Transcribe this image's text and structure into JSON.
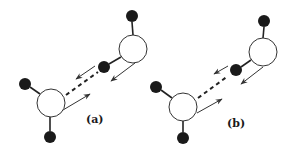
{
  "figure": {
    "colors": {
      "oxygen_fill": "#ffffff",
      "oxygen_stroke": "#333333",
      "hydrogen_fill": "#1a1a1a",
      "bond": "#222222",
      "arrow": "#333333"
    },
    "panels": [
      {
        "label": "(a)",
        "label_pos": [
          86,
          114
        ],
        "oxygens": [
          {
            "id": "O1",
            "cx": 133,
            "cy": 49,
            "r": 14
          },
          {
            "id": "O2",
            "cx": 51,
            "cy": 103,
            "r": 14
          }
        ],
        "hydrogens": [
          {
            "id": "H1a",
            "cx": 132,
            "cy": 16,
            "r": 6
          },
          {
            "id": "H1b",
            "cx": 104,
            "cy": 67,
            "r": 6
          },
          {
            "id": "H2a",
            "cx": 25,
            "cy": 84,
            "r": 6
          },
          {
            "id": "H2b",
            "cx": 50,
            "cy": 137,
            "r": 6
          }
        ],
        "bonds": [
          {
            "x1": 132,
            "y1": 22,
            "x2": 133,
            "y2": 35
          },
          {
            "x1": 109,
            "y1": 64,
            "x2": 121,
            "y2": 57
          },
          {
            "x1": 30,
            "y1": 87,
            "x2": 40,
            "y2": 94
          },
          {
            "x1": 50,
            "y1": 117,
            "x2": 50,
            "y2": 131
          }
        ],
        "hbond": {
          "x1": 66,
          "y1": 95,
          "x2": 98,
          "y2": 72
        },
        "arrows": [
          {
            "x1": 95,
            "y1": 66,
            "x2": 76,
            "y2": 79
          },
          {
            "x1": 135,
            "y1": 63,
            "x2": 111,
            "y2": 81
          },
          {
            "x1": 63,
            "y1": 110,
            "x2": 90,
            "y2": 94
          }
        ]
      },
      {
        "label": "(b)",
        "label_pos": [
          227,
          118
        ],
        "oxygens": [
          {
            "id": "O1",
            "cx": 263,
            "cy": 52,
            "r": 14
          },
          {
            "id": "O2",
            "cx": 183,
            "cy": 107,
            "r": 14
          }
        ],
        "hydrogens": [
          {
            "id": "H1a",
            "cx": 264,
            "cy": 21,
            "r": 6
          },
          {
            "id": "H1b",
            "cx": 236,
            "cy": 70,
            "r": 6
          },
          {
            "id": "H2a",
            "cx": 156,
            "cy": 87,
            "r": 6
          },
          {
            "id": "H2b",
            "cx": 183,
            "cy": 138,
            "r": 6
          }
        ],
        "bonds": [
          {
            "x1": 264,
            "y1": 27,
            "x2": 263,
            "y2": 38
          },
          {
            "x1": 241,
            "y1": 67,
            "x2": 251,
            "y2": 60
          },
          {
            "x1": 161,
            "y1": 90,
            "x2": 172,
            "y2": 98
          },
          {
            "x1": 183,
            "y1": 121,
            "x2": 183,
            "y2": 132
          }
        ],
        "hbond": {
          "x1": 198,
          "y1": 98,
          "x2": 228,
          "y2": 76
        },
        "arrows": [
          {
            "x1": 228,
            "y1": 66,
            "x2": 214,
            "y2": 74
          },
          {
            "x1": 263,
            "y1": 67,
            "x2": 241,
            "y2": 84
          },
          {
            "x1": 197,
            "y1": 113,
            "x2": 222,
            "y2": 99
          }
        ]
      }
    ]
  }
}
